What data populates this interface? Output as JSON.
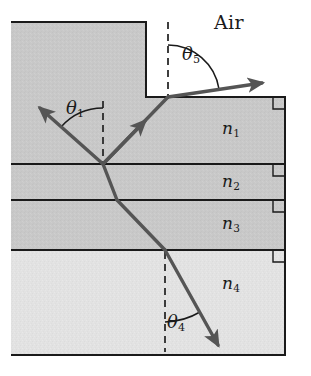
{
  "figure": {
    "type": "optics-ray-diagram",
    "canvas": {
      "width": 311,
      "height": 376,
      "background": "#ffffff"
    }
  },
  "colors": {
    "medium_upper_fill": "#c8c8c8",
    "medium_lower_fill": "#e2e2e2",
    "air_fill": "#ffffff",
    "outline": "#1a1a1a",
    "ray": "#555555",
    "dashed_normal": "#2a2a2a",
    "arc": "#1a1a1a",
    "text": "#1a1a1a"
  },
  "labels": {
    "air": "Air",
    "theta1": "θ",
    "theta1_sub": "1",
    "theta4": "θ",
    "theta4_sub": "4",
    "theta5": "θ",
    "theta5_sub": "5",
    "n1": "n",
    "n1_sub": "1",
    "n2": "n",
    "n2_sub": "2",
    "n3": "n",
    "n3_sub": "3",
    "n4": "n",
    "n4_sub": "4"
  },
  "media_layers": [
    {
      "name": "n1",
      "label": "n₁",
      "top_y": 97,
      "bottom_y": 164,
      "fill": "#c8c8c8"
    },
    {
      "name": "n2",
      "label": "n₂",
      "top_y": 164,
      "bottom_y": 200,
      "fill": "#c8c8c8"
    },
    {
      "name": "n3",
      "label": "n₃",
      "top_y": 200,
      "bottom_y": 250,
      "fill": "#c8c8c8"
    },
    {
      "name": "n4",
      "label": "n₄",
      "top_y": 250,
      "bottom_y": 355,
      "fill": "#e2e2e2"
    }
  ],
  "boundaries_y": [
    97,
    164,
    200,
    250,
    355
  ],
  "geometry": {
    "block_left_x": 11,
    "block_right_x": 285,
    "block_top_y": 22,
    "block_bottom_y": 355,
    "air_notch_left_x": 146,
    "air_notch_top_y": 22,
    "air_notch_bottom_y": 97,
    "incidence_point": {
      "x": 103,
      "y": 164
    },
    "exit_point": {
      "x": 168,
      "y": 97
    },
    "refraction_point_n2": {
      "x": 117,
      "y": 200
    },
    "refraction_point_n3n4": {
      "x": 165,
      "y": 250
    }
  },
  "rays": [
    {
      "name": "incident-ray",
      "points": [
        [
          103,
          164
        ],
        [
          40,
          108
        ]
      ],
      "arrow_at": "end",
      "description": "incident ray in medium n1 arriving at the n1/n2 boundary"
    },
    {
      "name": "reflected-ray",
      "points": [
        [
          103,
          164
        ],
        [
          168,
          97
        ]
      ],
      "arrow_at": "middle",
      "description": "upward ray travelling through n1 toward the air surface"
    },
    {
      "name": "exit-ray-in-air",
      "points": [
        [
          168,
          97
        ],
        [
          262,
          83
        ]
      ],
      "arrow_at": "end",
      "description": "refracted ray emerging into the air above the block"
    },
    {
      "name": "refracted-ray-n2",
      "points": [
        [
          103,
          164
        ],
        [
          117,
          200
        ]
      ],
      "arrow_at": "none",
      "description": "ray segment inside medium n2"
    },
    {
      "name": "refracted-ray-n3",
      "points": [
        [
          117,
          200
        ],
        [
          165,
          250
        ]
      ],
      "arrow_at": "none",
      "description": "ray segment inside medium n3"
    },
    {
      "name": "refracted-ray-n4",
      "points": [
        [
          165,
          250
        ],
        [
          218,
          345
        ]
      ],
      "arrow_at": "end",
      "description": "ray segment inside medium n4 leaving the figure"
    }
  ],
  "normals": [
    {
      "name": "normal-at-incidence",
      "x": 103,
      "y1": 101,
      "y2": 166
    },
    {
      "name": "normal-at-exit",
      "x": 168,
      "y1": 22,
      "y2": 99
    },
    {
      "name": "normal-in-n4",
      "x": 165,
      "y1": 252,
      "y2": 352
    }
  ],
  "angle_arcs": [
    {
      "name": "arc-theta1",
      "vertex": [
        103,
        164
      ],
      "radius": 56,
      "start_deg": 222,
      "end_deg": 270,
      "label": "theta1"
    },
    {
      "name": "arc-theta5",
      "vertex": [
        168,
        97
      ],
      "radius": 52,
      "start_deg": 270,
      "end_deg": 351,
      "label": "theta5"
    },
    {
      "name": "arc-theta4",
      "vertex": [
        165,
        250
      ],
      "radius": 72,
      "start_deg": 61,
      "end_deg": 90,
      "label": "theta4"
    }
  ],
  "right_angle_marks": [
    {
      "name": "right-angle-n1-top",
      "x": 285,
      "y": 97
    },
    {
      "name": "right-angle-n1-n2",
      "x": 285,
      "y": 164
    },
    {
      "name": "right-angle-n2-n3",
      "x": 285,
      "y": 200
    },
    {
      "name": "right-angle-n3-n4",
      "x": 285,
      "y": 250
    }
  ]
}
